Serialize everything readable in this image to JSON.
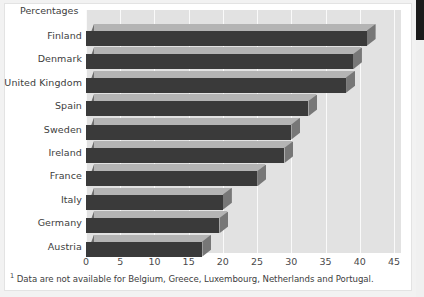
{
  "figure": {
    "axis_title": "Percentages",
    "footnote_marker": "1",
    "footnote_text": "Data are not available for Belgium, Greece, Luxembourg, Netherlands and Portugal."
  },
  "colors": {
    "plot_background": "#e2e2e2",
    "gridline": "#fafafa",
    "bar_front": "#3a3a3a",
    "bar_top": "#b4b4b4",
    "bar_side": "#6e6e6e",
    "page_background": "#ffffff",
    "text": "#3d3d3d"
  },
  "chart_data": {
    "type": "bar",
    "orientation": "horizontal",
    "title": "",
    "subtitle": "",
    "xlabel": "",
    "ylabel": "",
    "axis_title": "Percentages",
    "categories": [
      "Finland",
      "Denmark",
      "United Kingdom",
      "Spain",
      "Sweden",
      "Ireland",
      "France",
      "Italy",
      "Germany",
      "Austria"
    ],
    "values": [
      41,
      39,
      38,
      32.5,
      30,
      29,
      25,
      20,
      19.5,
      17
    ],
    "xlim": [
      0,
      45
    ],
    "xticks": [
      0,
      5,
      10,
      15,
      20,
      25,
      30,
      35,
      40,
      45
    ],
    "xtick_labels": [
      "0",
      "5",
      "10",
      "15",
      "20",
      "25",
      "30",
      "35",
      "40",
      "45"
    ],
    "grid": true,
    "grid_axis": "x",
    "legend": false,
    "legend_position": "none",
    "style": "3d-bar"
  }
}
